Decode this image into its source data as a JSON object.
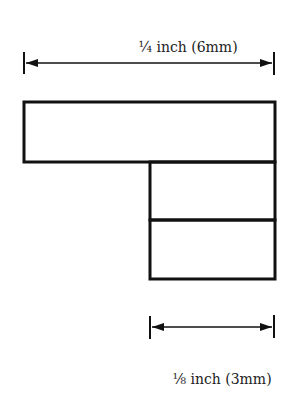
{
  "diagram": {
    "top_dimension": {
      "label": "¼ inch (6mm)",
      "from_x": 24,
      "to_x": 274,
      "y": 63
    },
    "bottom_dimension": {
      "label": "⅛ inch (3mm)",
      "from_x": 150,
      "to_x": 274,
      "y": 327
    },
    "shapes": [
      {
        "name": "wide-bar",
        "x": 24,
        "y": 102,
        "w": 251,
        "h": 60
      },
      {
        "name": "upper-small-block",
        "x": 150,
        "y": 162,
        "w": 125,
        "h": 58
      },
      {
        "name": "lower-small-block",
        "x": 150,
        "y": 220,
        "w": 125,
        "h": 59
      }
    ],
    "stroke_color": "#111111"
  }
}
